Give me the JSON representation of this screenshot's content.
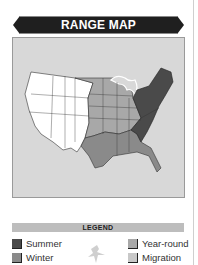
{
  "header": {
    "title": "RANGE MAP"
  },
  "map": {
    "description": "Map of contiguous United States with shaded range zones",
    "zones": [
      {
        "name": "western-states",
        "fill": "#ffffff"
      },
      {
        "name": "plains-midwest",
        "fill": "#a8a8a8"
      },
      {
        "name": "south-coast",
        "fill": "#8a8a8a"
      },
      {
        "name": "northeast-appalachia",
        "fill": "#4a4a4a"
      }
    ]
  },
  "legend": {
    "title": "LEGEND",
    "items": [
      {
        "label": "Summer",
        "color": "#4a4a4a"
      },
      {
        "label": "Winter",
        "color": "#8a8a8a"
      },
      {
        "label": "Year-round",
        "color": "#a8a8a8"
      },
      {
        "label": "Migration",
        "color": "#c8c8c8"
      }
    ],
    "icon": "bird-silhouette-icon"
  }
}
